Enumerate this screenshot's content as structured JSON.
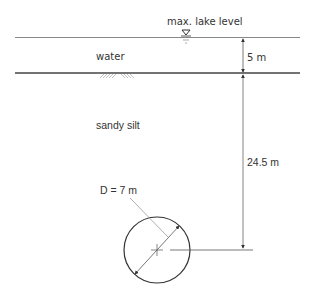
{
  "labels": {
    "max_lake_level": "max. lake level",
    "water": "water",
    "sandy_silt": "sandy silt",
    "water_depth": "5 m",
    "cover_depth": "24.5 m",
    "diameter": "D = 7 m"
  },
  "colors": {
    "line": "#555555",
    "thin_line": "#888888",
    "text": "#333333",
    "background": "#ffffff"
  },
  "icons": {
    "water_level_symbol": "inverted-triangle",
    "ground_hatch": "soil-hatch",
    "centerline_cross": "cross"
  }
}
